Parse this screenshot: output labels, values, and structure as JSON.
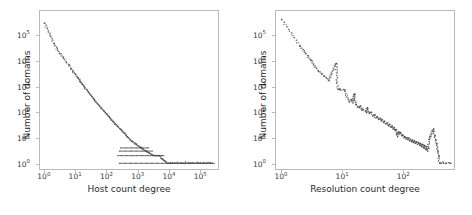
{
  "figure": {
    "background_color": "#ffffff",
    "marker_color": "#4d4d4d",
    "frame_color": "#b9b9b9",
    "text_color": "#2b2b2b"
  },
  "chart_data": [
    {
      "type": "scatter",
      "title": "",
      "xlabel": "Host count degree",
      "ylabel": "Number of domains",
      "xscale": "log",
      "yscale": "log",
      "xlim": [
        0.7,
        400000
      ],
      "ylim": [
        0.6,
        900000
      ],
      "grid": false,
      "legend": null,
      "xticks": [
        "10^0",
        "10^1",
        "10^2",
        "10^3",
        "10^4",
        "10^5"
      ],
      "xtick_values": [
        1,
        10,
        100,
        1000,
        10000,
        100000
      ],
      "ytick_values": [
        1,
        10,
        100,
        1000,
        10000,
        100000
      ],
      "yticks": [
        "10^0",
        "10^1",
        "10^2",
        "10^3",
        "10^4",
        "10^5"
      ],
      "description": "Heavy-tailed power-law degree distribution of host count degree versus number of domains; a dense near-linear cloud on log-log axes decaying from ~3x10^5 domains at degree 1 down to single-domain counts, with horizontal saturation streaks at counts 1, 2, 3 and 4 extending to degrees of order 10^5.",
      "points": [
        [
          1,
          300000
        ],
        [
          2,
          48000
        ],
        [
          3,
          20000
        ],
        [
          4,
          14000
        ],
        [
          5,
          9000
        ],
        [
          6,
          7000
        ],
        [
          7,
          5000
        ],
        [
          8,
          4000
        ],
        [
          9,
          3400
        ],
        [
          10,
          3000
        ],
        [
          11,
          2400
        ],
        [
          12,
          2100
        ],
        [
          13,
          1850
        ],
        [
          14,
          1650
        ],
        [
          15,
          1450
        ],
        [
          16,
          1300
        ],
        [
          17,
          1180
        ],
        [
          18,
          1080
        ],
        [
          19,
          980
        ],
        [
          20,
          900
        ],
        [
          22,
          780
        ],
        [
          24,
          680
        ],
        [
          26,
          600
        ],
        [
          28,
          530
        ],
        [
          30,
          470
        ],
        [
          33,
          410
        ],
        [
          36,
          360
        ],
        [
          39,
          320
        ],
        [
          42,
          285
        ],
        [
          46,
          250
        ],
        [
          50,
          220
        ],
        [
          55,
          195
        ],
        [
          60,
          172
        ],
        [
          65,
          153
        ],
        [
          70,
          137
        ],
        [
          76,
          122
        ],
        [
          83,
          108
        ],
        [
          90,
          96
        ],
        [
          98,
          86
        ],
        [
          106,
          77
        ],
        [
          115,
          69
        ],
        [
          125,
          62
        ],
        [
          136,
          55
        ],
        [
          148,
          49
        ],
        [
          160,
          44
        ],
        [
          174,
          40
        ],
        [
          189,
          36
        ],
        [
          205,
          32
        ],
        [
          223,
          29
        ],
        [
          242,
          26
        ],
        [
          263,
          23
        ],
        [
          286,
          21
        ],
        [
          310,
          19
        ],
        [
          337,
          17
        ],
        [
          366,
          15
        ],
        [
          398,
          14
        ],
        [
          432,
          12
        ],
        [
          470,
          11
        ],
        [
          510,
          10
        ],
        [
          554,
          9
        ],
        [
          602,
          8
        ],
        [
          654,
          7.5
        ],
        [
          710,
          7
        ],
        [
          772,
          6.4
        ],
        [
          839,
          6
        ],
        [
          911,
          5.5
        ],
        [
          990,
          5
        ],
        [
          1076,
          4.7
        ],
        [
          1169,
          4.4
        ],
        [
          1270,
          4.1
        ],
        [
          1380,
          3.8
        ],
        [
          1500,
          3.6
        ],
        [
          1630,
          3.3
        ],
        [
          1770,
          3.1
        ],
        [
          1923,
          3
        ],
        [
          2090,
          2.8
        ],
        [
          2271,
          2.6
        ],
        [
          2468,
          2.5
        ],
        [
          2682,
          2.3
        ],
        [
          2914,
          2.2
        ],
        [
          3166,
          2.1
        ],
        [
          3440,
          2
        ],
        [
          3738,
          2
        ],
        [
          4062,
          2
        ],
        [
          4413,
          2
        ],
        [
          4795,
          2
        ],
        [
          5210,
          2
        ],
        [
          5661,
          1.6
        ],
        [
          6151,
          1.5
        ],
        [
          6683,
          1.4
        ],
        [
          7262,
          1.3
        ],
        [
          7890,
          1.2
        ],
        [
          8573,
          1.1
        ],
        [
          9315,
          1
        ],
        [
          10122,
          1
        ],
        [
          11000,
          1
        ],
        [
          13000,
          1
        ],
        [
          15500,
          1
        ],
        [
          18500,
          1
        ],
        [
          22000,
          1
        ],
        [
          26000,
          1
        ],
        [
          31000,
          1
        ],
        [
          37000,
          1
        ],
        [
          44000,
          1
        ],
        [
          52000,
          1
        ],
        [
          62000,
          1
        ],
        [
          74000,
          1
        ],
        [
          88000,
          1
        ],
        [
          105000,
          1
        ],
        [
          125000,
          1
        ],
        [
          150000,
          1
        ],
        [
          180000,
          1
        ],
        [
          215000,
          1
        ],
        [
          260000,
          1
        ]
      ],
      "saturation_streaks": [
        {
          "y": 1,
          "x_start": 260,
          "x_end": 300000
        },
        {
          "y": 2,
          "x_start": 230,
          "x_end": 7000
        },
        {
          "y": 3,
          "x_start": 260,
          "x_end": 3000
        },
        {
          "y": 4,
          "x_start": 280,
          "x_end": 2300
        }
      ]
    },
    {
      "type": "scatter",
      "title": "",
      "xlabel": "Resolution count degree",
      "ylabel": "Number of domains",
      "xscale": "log",
      "yscale": "log",
      "xlim": [
        0.8,
        700
      ],
      "ylim": [
        0.6,
        900000
      ],
      "grid": false,
      "legend": null,
      "xticks": [
        "10^0",
        "10^1",
        "10^2"
      ],
      "xtick_values": [
        1,
        10,
        100
      ],
      "ytick_values": [
        1,
        10,
        100,
        1000,
        10000,
        100000
      ],
      "yticks": [
        "10^0",
        "10^1",
        "10^2",
        "10^3",
        "10^4",
        "10^5"
      ],
      "description": "Power-law-like decay of resolution count degree versus number of domains on log-log axes; sparse isolated markers at low degree falling from ~4x10^5 domains, becoming a noisy dense band around 10 domains for degrees near 10^2, with a slight upturn and scattered single-domain points at the largest degrees.",
      "points": [
        [
          1,
          420000
        ],
        [
          2,
          38000
        ],
        [
          3,
          11000
        ],
        [
          4,
          4200
        ],
        [
          5,
          2600
        ],
        [
          6,
          1700
        ],
        [
          8,
          8000
        ],
        [
          8.5,
          780
        ],
        [
          9,
          760
        ],
        [
          11,
          740
        ],
        [
          13,
          250
        ],
        [
          14,
          300
        ],
        [
          15,
          230
        ],
        [
          16,
          520
        ],
        [
          17,
          200
        ],
        [
          18,
          160
        ],
        [
          19,
          150
        ],
        [
          20,
          175
        ],
        [
          21,
          120
        ],
        [
          22,
          130
        ],
        [
          24,
          110
        ],
        [
          25,
          95
        ],
        [
          26,
          150
        ],
        [
          28,
          88
        ],
        [
          30,
          100
        ],
        [
          32,
          70
        ],
        [
          34,
          78
        ],
        [
          36,
          60
        ],
        [
          38,
          66
        ],
        [
          40,
          52
        ],
        [
          42,
          58
        ],
        [
          44,
          45
        ],
        [
          46,
          50
        ],
        [
          48,
          40
        ],
        [
          50,
          44
        ],
        [
          52,
          35
        ],
        [
          55,
          38
        ],
        [
          58,
          30
        ],
        [
          60,
          33
        ],
        [
          63,
          26
        ],
        [
          66,
          29
        ],
        [
          69,
          22
        ],
        [
          72,
          25
        ],
        [
          75,
          19
        ],
        [
          78,
          21
        ],
        [
          82,
          11
        ],
        [
          85,
          17
        ],
        [
          88,
          14
        ],
        [
          92,
          16
        ],
        [
          96,
          12
        ],
        [
          100,
          13
        ],
        [
          104,
          10
        ],
        [
          108,
          11
        ],
        [
          112,
          9
        ],
        [
          116,
          10
        ],
        [
          120,
          8.5
        ],
        [
          125,
          9.5
        ],
        [
          130,
          7.5
        ],
        [
          135,
          8.5
        ],
        [
          140,
          7
        ],
        [
          145,
          8
        ],
        [
          150,
          6.5
        ],
        [
          156,
          7.5
        ],
        [
          162,
          6
        ],
        [
          168,
          7
        ],
        [
          175,
          5.5
        ],
        [
          182,
          6.5
        ],
        [
          189,
          5
        ],
        [
          196,
          6
        ],
        [
          204,
          4.5
        ],
        [
          212,
          5.5
        ],
        [
          220,
          4
        ],
        [
          229,
          5
        ],
        [
          238,
          3.5
        ],
        [
          247,
          4.5
        ],
        [
          257,
          3
        ],
        [
          267,
          4
        ],
        [
          278,
          9
        ],
        [
          289,
          11
        ],
        [
          300,
          14
        ],
        [
          312,
          18
        ],
        [
          324,
          22
        ],
        [
          337,
          12
        ],
        [
          350,
          8
        ],
        [
          364,
          6
        ],
        [
          378,
          3
        ],
        [
          393,
          2
        ],
        [
          408,
          1
        ],
        [
          424,
          1
        ],
        [
          470,
          1
        ],
        [
          520,
          1
        ],
        [
          620,
          1
        ]
      ]
    }
  ],
  "panels": [
    {
      "name": "host-count-degree-panel",
      "xlabel": "Host count degree",
      "ylabel": "Number of domains",
      "xticks": [
        {
          "label_base": "10",
          "label_exp": "0"
        },
        {
          "label_base": "10",
          "label_exp": "1"
        },
        {
          "label_base": "10",
          "label_exp": "2"
        },
        {
          "label_base": "10",
          "label_exp": "3"
        },
        {
          "label_base": "10",
          "label_exp": "4"
        },
        {
          "label_base": "10",
          "label_exp": "5"
        }
      ],
      "yticks": [
        {
          "label_base": "10",
          "label_exp": "0"
        },
        {
          "label_base": "10",
          "label_exp": "1"
        },
        {
          "label_base": "10",
          "label_exp": "2"
        },
        {
          "label_base": "10",
          "label_exp": "3"
        },
        {
          "label_base": "10",
          "label_exp": "4"
        },
        {
          "label_base": "10",
          "label_exp": "5"
        }
      ]
    },
    {
      "name": "resolution-count-degree-panel",
      "xlabel": "Resolution count degree",
      "ylabel": "Number of domains",
      "xticks": [
        {
          "label_base": "10",
          "label_exp": "0"
        },
        {
          "label_base": "10",
          "label_exp": "1"
        },
        {
          "label_base": "10",
          "label_exp": "2"
        }
      ],
      "yticks": [
        {
          "label_base": "10",
          "label_exp": "0"
        },
        {
          "label_base": "10",
          "label_exp": "1"
        },
        {
          "label_base": "10",
          "label_exp": "2"
        },
        {
          "label_base": "10",
          "label_exp": "3"
        },
        {
          "label_base": "10",
          "label_exp": "4"
        },
        {
          "label_base": "10",
          "label_exp": "5"
        }
      ]
    }
  ]
}
